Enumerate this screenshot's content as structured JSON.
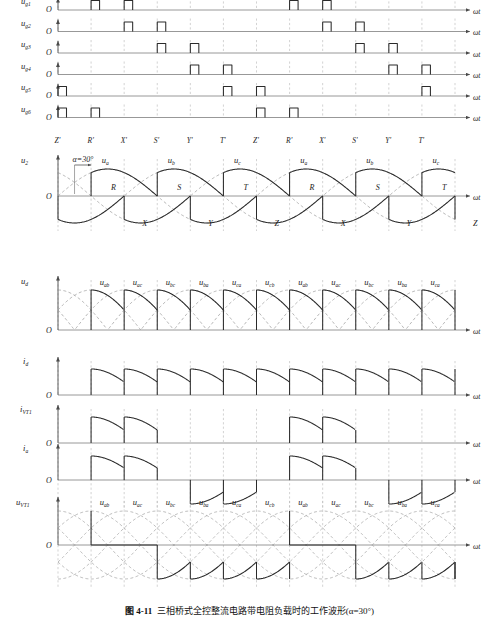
{
  "figure": {
    "caption_bold": "图 4-11",
    "caption_text": "三相桥式全控整流电路带电阻负载时的工作波形(α=30°)",
    "x_axis_label": "ωt",
    "origin_label": "O",
    "alpha_label": "α=30°"
  },
  "colors": {
    "curve": "#2b2b2b",
    "dashed": "#9a9a9a",
    "axis": "#8c8c8c",
    "grid": "#b5b5b5",
    "text": "#1a1a1a"
  },
  "tick_labels": [
    "Z'",
    "R'",
    "X'",
    "S'",
    "Y'",
    "T'",
    "Z'",
    "R'",
    "X'",
    "S'",
    "Y'",
    "T'"
  ],
  "gate_pulses": {
    "rows": [
      {
        "label": "u",
        "subscript": "g1",
        "pulse_indices": [
          1,
          2,
          7,
          8
        ]
      },
      {
        "label": "u",
        "subscript": "g2",
        "pulse_indices": [
          2,
          3,
          8,
          9
        ]
      },
      {
        "label": "u",
        "subscript": "g3",
        "pulse_indices": [
          3,
          4,
          9,
          10
        ]
      },
      {
        "label": "u",
        "subscript": "g4",
        "pulse_indices": [
          4,
          5,
          10,
          11
        ]
      },
      {
        "label": "u",
        "subscript": "g5",
        "pulse_indices": [
          0,
          5,
          6,
          11
        ]
      },
      {
        "label": "u",
        "subscript": "g6",
        "pulse_indices": [
          0,
          1,
          6,
          7
        ]
      }
    ]
  },
  "u2_section": {
    "label": "u",
    "subscript": "2",
    "phase_labels": [
      "uₐ",
      "uᵇ",
      "uᶜ"
    ],
    "phase_names": [
      "a",
      "b",
      "c"
    ],
    "upper_markers": [
      "R",
      "S",
      "T",
      "R",
      "S",
      "T"
    ],
    "lower_markers": [
      "X",
      "Y",
      "Z",
      "X",
      "Y",
      "Z"
    ],
    "alpha_deg": 30
  },
  "ud_section": {
    "label": "u",
    "subscript": "d",
    "segment_labels": [
      "ab",
      "ac",
      "bc",
      "ba",
      "ca",
      "cb",
      "ab",
      "ac",
      "bc",
      "ba",
      "ca"
    ]
  },
  "id_section": {
    "label": "i",
    "subscript": "d"
  },
  "ivt1_section": {
    "label": "i",
    "subscript": "VT1"
  },
  "ia_section": {
    "label": "i",
    "subscript": "a"
  },
  "uvt1_section": {
    "label": "u",
    "subscript": "VT1",
    "segment_labels": [
      "ab",
      "ac",
      "bc",
      "ba",
      "ca",
      "cb",
      "ab",
      "ac",
      "bc",
      "ba",
      "ca"
    ]
  },
  "chart_data": {
    "type": "line",
    "title": "三相桥式全控整流电路带电阻负载时的工作波形(α=30°)",
    "xlabel": "ωt",
    "alpha_deg": 30,
    "commutation_points_deg": [
      0,
      60,
      120,
      180,
      240,
      300,
      360,
      420,
      480,
      540,
      600,
      660
    ],
    "series": [
      {
        "name": "u_g1",
        "type": "pulse",
        "fire_angles_deg": [
          60,
          120,
          420,
          480
        ]
      },
      {
        "name": "u_g2",
        "type": "pulse",
        "fire_angles_deg": [
          120,
          180,
          480,
          540
        ]
      },
      {
        "name": "u_g3",
        "type": "pulse",
        "fire_angles_deg": [
          180,
          240,
          540,
          600
        ]
      },
      {
        "name": "u_g4",
        "type": "pulse",
        "fire_angles_deg": [
          240,
          300,
          600,
          660
        ]
      },
      {
        "name": "u_g5",
        "type": "pulse",
        "fire_angles_deg": [
          0,
          300,
          360,
          660
        ]
      },
      {
        "name": "u_g6",
        "type": "pulse",
        "fire_angles_deg": [
          0,
          60,
          360,
          420
        ]
      },
      {
        "name": "u_a",
        "type": "sine",
        "phase_deg": 0,
        "amplitude": 1
      },
      {
        "name": "u_b",
        "type": "sine",
        "phase_deg": -120,
        "amplitude": 1
      },
      {
        "name": "u_c",
        "type": "sine",
        "phase_deg": -240,
        "amplitude": 1
      },
      {
        "name": "u_d",
        "type": "rectified",
        "pulses_per_cycle": 6,
        "conduction_deg": 60
      },
      {
        "name": "i_d",
        "type": "rectified",
        "pulses_per_cycle": 6,
        "conduction_deg": 60
      },
      {
        "name": "i_VT1",
        "type": "gated",
        "conduction_deg": 120
      },
      {
        "name": "i_a",
        "type": "bipolar",
        "conduction_deg": 120
      },
      {
        "name": "u_VT1",
        "type": "blocking",
        "conduction_deg": 120
      }
    ]
  }
}
